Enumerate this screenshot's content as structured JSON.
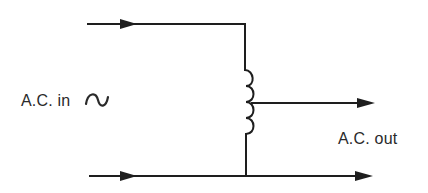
{
  "diagram": {
    "type": "autotransformer-circuit",
    "labels": {
      "input": "A.C. in",
      "output": "A.C. out"
    },
    "icons": {
      "ac_source_symbol": "sine-wave-tilde-icon",
      "arrows": "arrowhead-icon",
      "coil": "inductor-coil-icon"
    },
    "components": [
      {
        "id": "input-top-wire",
        "direction": "right"
      },
      {
        "id": "input-bottom-wire",
        "direction": "right"
      },
      {
        "id": "coil",
        "turns": 4,
        "tap": "center"
      },
      {
        "id": "output-tap-wire",
        "direction": "right"
      },
      {
        "id": "output-bottom-wire",
        "direction": "right"
      }
    ],
    "colors": {
      "line": "#1e1e1e",
      "text": "#2a2a2a",
      "background": "#ffffff"
    }
  }
}
